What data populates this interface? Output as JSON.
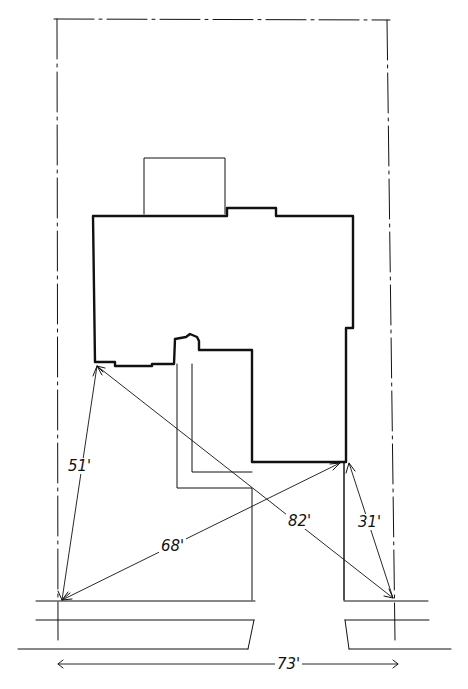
{
  "diagram": {
    "type": "site-plan",
    "colors": {
      "ink": "#111111",
      "background": "#ffffff"
    },
    "dimensions": [
      {
        "id": "d51",
        "label": "51'"
      },
      {
        "id": "d68",
        "label": "68'"
      },
      {
        "id": "d82",
        "label": "82'"
      },
      {
        "id": "d31",
        "label": "31'"
      },
      {
        "id": "d73",
        "label": "73'"
      }
    ]
  }
}
